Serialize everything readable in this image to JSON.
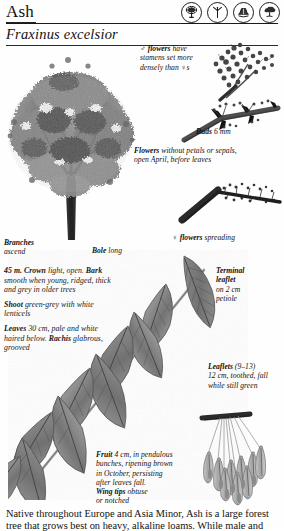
{
  "header": {
    "common_name": "Ash",
    "scientific_name": "Fraxinus excelsior"
  },
  "icons": [
    {
      "name": "tree-habit-icon",
      "label": "tree silhouette"
    },
    {
      "name": "leaf-shape-icon",
      "label": "compound leaf"
    },
    {
      "name": "bark-texture-icon",
      "label": "bark"
    },
    {
      "name": "crown-shape-icon",
      "label": "crown"
    }
  ],
  "captions": {
    "male_flowers": {
      "lines": [
        "♂ flowers have",
        "stamens set more",
        "densely than ♀s"
      ],
      "bold_word": "flowers",
      "symbol": "♂"
    },
    "buds": {
      "bold": "Buds",
      "rest": "6 mm"
    },
    "flowers_general": {
      "bold": "Flowers",
      "rest_line1": "without petals or sepals,",
      "rest_line2": "open April, before leaves"
    },
    "female_flowers": {
      "symbol": "♀",
      "bold": "flowers",
      "rest": "spreading"
    },
    "branches": {
      "bold": "Branches",
      "rest": "ascend"
    },
    "bole": {
      "bold": "Bole",
      "rest": "long"
    },
    "terminal_leaflet": {
      "bold_line1": "Terminal",
      "bold_line2": "leaflet",
      "rest_line1": "on 2 cm",
      "rest_line2": "petiole"
    },
    "leaflets": {
      "bold": "Leaflets",
      "rest_line1": "(9–13)",
      "rest_line2": "12 cm, toothed, fall",
      "rest_line3": "while still green"
    },
    "fruit": {
      "bold": "Fruit",
      "rest_line1": "4 cm, in pendulous",
      "rest_line2": "bunches, ripening brown",
      "rest_line3": "in October, persisting",
      "rest_line4": "after leaves fall.",
      "bold2": "Wing tips",
      "rest_line5": "obtuse",
      "rest_line6": "or notched"
    }
  },
  "description_block": {
    "height_crown_bark": {
      "lead": "45 m. ",
      "b1": "Crown",
      "t1": " light, open. ",
      "b2": "Bark",
      "t2": "smooth when young, ridged, thick and grey in older trees"
    },
    "shoot": {
      "b": "Shoot",
      "t": " green-grey with white lenticels"
    },
    "leaves": {
      "b": "Leaves",
      "t1": " 30 cm, pale and white haired below. ",
      "b2": "Rachis",
      "t2": "glabrous, grooved"
    }
  },
  "body_text": {
    "line1": "Native throughout Europe and Asia Minor, Ash is a large forest",
    "line2": "tree that grows best on heavy, alkaline loams. While male and"
  },
  "illustrations": [
    {
      "name": "tree-habit-illustration",
      "subject": "mature ash tree in leaf"
    },
    {
      "name": "male-flower-cluster-illustration",
      "subject": "male flower cluster on twig"
    },
    {
      "name": "bud-twig-illustration",
      "subject": "twig with opposite black buds"
    },
    {
      "name": "female-flower-twig-illustration",
      "subject": "twig with spreading female flowers"
    },
    {
      "name": "compound-leaf-illustration",
      "subject": "pinnate compound leaf with leaflets"
    },
    {
      "name": "samara-cluster-illustration",
      "subject": "hanging bunch of winged fruits"
    }
  ],
  "colors": {
    "ink": "#111111",
    "rule": "#1a1a1a",
    "paper": "#fefefe",
    "illustration_dark": "#3a3a3a",
    "illustration_mid": "#7d7d7d",
    "illustration_light": "#b9b9b9"
  }
}
